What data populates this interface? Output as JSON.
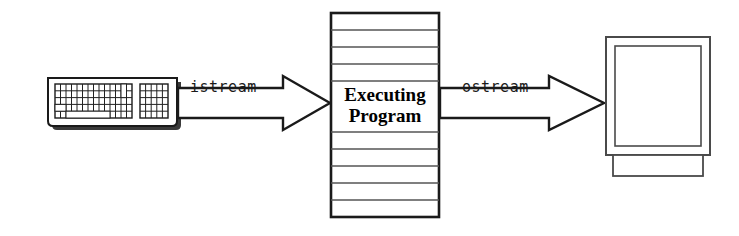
{
  "diagram": {
    "background_color": "#ffffff",
    "stroke_color": "#1a1a1a",
    "shadow_color": "#333333",
    "rule_color": "#555555",
    "input_device": {
      "name": "keyboard",
      "main_key_grid": {
        "columns": 14,
        "rows": 5
      },
      "keypad_grid": {
        "columns": 5,
        "rows": 5
      }
    },
    "input_arrow": {
      "label": "istream",
      "direction": "right",
      "from": "keyboard",
      "to": "executing-program"
    },
    "process_box": {
      "line1": "Executing",
      "line2": "Program",
      "rule_lines": 11
    },
    "output_arrow": {
      "label": "ostream",
      "direction": "right",
      "from": "executing-program",
      "to": "monitor"
    },
    "output_device": {
      "name": "monitor",
      "has_screen": true,
      "has_base": true
    }
  }
}
